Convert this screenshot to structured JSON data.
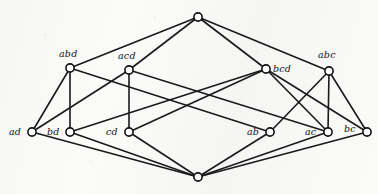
{
  "figure": {
    "kind": "hasse-diagram",
    "title": "",
    "background_color": "#fbfbfa",
    "edge_color": "#1a1a1a",
    "vertex_fill": "#ffffff",
    "vertex_stroke": "#121212",
    "vertex_radius": 4.1,
    "width": 378,
    "height": 194
  },
  "chart_data": {
    "type": "diagram",
    "title": "",
    "nodes": [
      {
        "id": "top",
        "label": "",
        "x": 198,
        "y": 17,
        "label_dx": 0,
        "label_dy": 0,
        "rank": 0
      },
      {
        "id": "abd",
        "label": "abd",
        "x": 70,
        "y": 68,
        "label_dx": -11,
        "label_dy": -19,
        "rank": 1
      },
      {
        "id": "acd",
        "label": "acd",
        "x": 129,
        "y": 70,
        "label_dx": -11,
        "label_dy": -19,
        "rank": 1
      },
      {
        "id": "bcd",
        "label": "bcd",
        "x": 266,
        "y": 69,
        "label_dx": 7,
        "label_dy": -5,
        "rank": 1
      },
      {
        "id": "abc",
        "label": "abc",
        "x": 329,
        "y": 71,
        "label_dx": -11,
        "label_dy": -21,
        "rank": 1
      },
      {
        "id": "ad",
        "label": "ad",
        "x": 32,
        "y": 132,
        "label_dx": -23,
        "label_dy": -5,
        "rank": 2
      },
      {
        "id": "bd",
        "label": "bd",
        "x": 70,
        "y": 132,
        "label_dx": -23,
        "label_dy": -5,
        "rank": 2
      },
      {
        "id": "cd",
        "label": "cd",
        "x": 129,
        "y": 132,
        "label_dx": -23,
        "label_dy": -5,
        "rank": 2
      },
      {
        "id": "ab",
        "label": "ab",
        "x": 270,
        "y": 132,
        "label_dx": -23,
        "label_dy": -5,
        "rank": 2
      },
      {
        "id": "ac",
        "label": "ac",
        "x": 328,
        "y": 132,
        "label_dx": -23,
        "label_dy": -5,
        "rank": 2
      },
      {
        "id": "bc",
        "label": "bc",
        "x": 367,
        "y": 132,
        "label_dx": -23,
        "label_dy": -8,
        "rank": 2
      },
      {
        "id": "bot",
        "label": "",
        "x": 198,
        "y": 177,
        "label_dx": 0,
        "label_dy": 0,
        "rank": 3
      }
    ],
    "edges": [
      [
        "top",
        "abd"
      ],
      [
        "top",
        "acd"
      ],
      [
        "top",
        "bcd"
      ],
      [
        "top",
        "abc"
      ],
      [
        "abd",
        "ad"
      ],
      [
        "abd",
        "bd"
      ],
      [
        "abd",
        "ab"
      ],
      [
        "acd",
        "ad"
      ],
      [
        "acd",
        "cd"
      ],
      [
        "acd",
        "ac"
      ],
      [
        "bcd",
        "bd"
      ],
      [
        "bcd",
        "cd"
      ],
      [
        "bcd",
        "bc"
      ],
      [
        "bcd",
        "ac"
      ],
      [
        "abc",
        "ab"
      ],
      [
        "abc",
        "ac"
      ],
      [
        "abc",
        "bc"
      ],
      [
        "ad",
        "bot"
      ],
      [
        "bd",
        "bot"
      ],
      [
        "cd",
        "bot"
      ],
      [
        "ab",
        "bot"
      ],
      [
        "ac",
        "bot"
      ],
      [
        "bc",
        "bot"
      ]
    ]
  }
}
